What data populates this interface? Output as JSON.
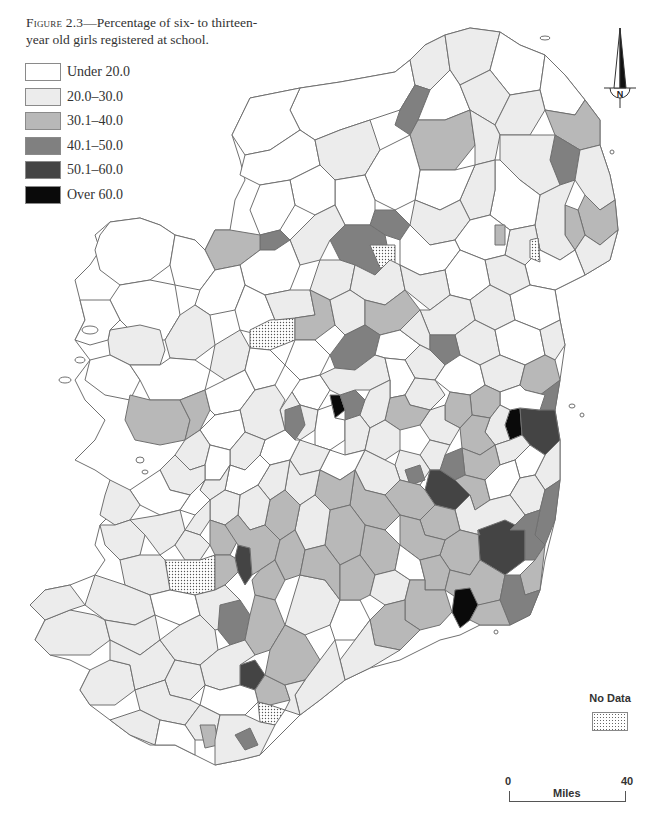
{
  "caption": {
    "figure_label": "Figure 2.3",
    "text": "—Percentage of six- to thirteen-year old girls registered at school."
  },
  "legend": {
    "items": [
      {
        "label": "Under 20.0",
        "color": "#ffffff"
      },
      {
        "label": "20.0–30.0",
        "color": "#ececec"
      },
      {
        "label": "30.1–40.0",
        "color": "#b8b8b8"
      },
      {
        "label": "40.1–50.0",
        "color": "#808080"
      },
      {
        "label": "50.1–60.0",
        "color": "#444444"
      },
      {
        "label": "Over 60.0",
        "color": "#0a0a0a"
      }
    ]
  },
  "no_data": {
    "label": "No Data",
    "pattern": "dotted"
  },
  "compass": {
    "label": "N"
  },
  "scale_bar": {
    "start": "0",
    "end": "40",
    "unit": "Miles"
  },
  "map": {
    "subject": "Ireland",
    "boundary_color": "#707070",
    "classes": {
      "c0": "#ffffff",
      "c1": "#ececec",
      "c2": "#b8b8b8",
      "c3": "#808080",
      "c4": "#444444",
      "c5": "#0a0a0a"
    }
  }
}
